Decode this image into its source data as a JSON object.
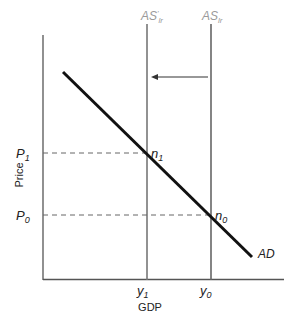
{
  "diagram": {
    "title": "",
    "x_axis_label": "GDP",
    "y_axis_label": "Price",
    "curves": {
      "ad": {
        "label": "AD"
      },
      "as_lr_new": {
        "label": "AS",
        "prime": "'",
        "subscript": "lr"
      },
      "as_lr_old": {
        "label": "AS",
        "subscript": "lr"
      }
    },
    "price_levels": [
      {
        "label": "P",
        "subscript": "1"
      },
      {
        "label": "P",
        "subscript": "0"
      }
    ],
    "output_levels": [
      {
        "label": "y",
        "subscript": "1"
      },
      {
        "label": "y",
        "subscript": "0"
      }
    ],
    "equilibria": [
      {
        "label": "n",
        "subscript": "1"
      },
      {
        "label": "n",
        "subscript": "0"
      }
    ],
    "shift_arrow": {
      "direction": "left"
    }
  }
}
